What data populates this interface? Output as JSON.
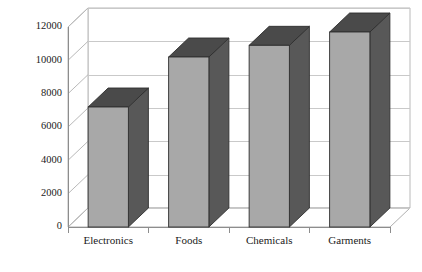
{
  "chart_data": {
    "type": "bar",
    "title": "",
    "subtitle": "",
    "xlabel": "",
    "ylabel": "",
    "categories": [
      "Electronics",
      "Foods",
      "Chemicals",
      "Garments"
    ],
    "values": [
      7200,
      10200,
      10900,
      11700
    ],
    "series": [
      {
        "name": "",
        "values": [
          7200,
          10200,
          10900,
          11700
        ]
      }
    ],
    "ylim": [
      0,
      12000
    ],
    "ytick_labels": [
      "0",
      "2000",
      "4000",
      "6000",
      "8000",
      "10000",
      "12000"
    ],
    "ytick_values": [
      0,
      2000,
      4000,
      6000,
      8000,
      10000,
      12000
    ],
    "grid": true,
    "legend": "none",
    "style": "3d-column",
    "colors": {
      "bar_front": "#a8a8a8",
      "bar_side": "#585858",
      "bar_top": "#4a4a4a",
      "bar_outline": "#2f2f2f",
      "gridline": "#c9c9c9",
      "axis": "#8d8d8d",
      "wall": "#b9b9b9",
      "background": "#ffffff",
      "text": "#1a1a1a"
    }
  },
  "footer": {
    "clipped_text": "___ _  _  _ _____  ___ _  __ _  _ ___  _ __ _ _  ___"
  }
}
